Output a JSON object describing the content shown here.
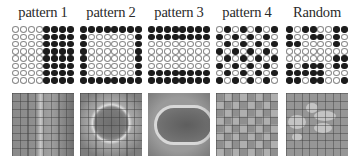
{
  "figure": {
    "columns": [
      {
        "title": "pattern 1",
        "grid": [
          [
            0,
            0,
            0,
            0,
            1,
            1,
            1,
            1
          ],
          [
            0,
            0,
            0,
            0,
            1,
            1,
            1,
            1
          ],
          [
            0,
            0,
            0,
            0,
            1,
            1,
            1,
            1
          ],
          [
            0,
            0,
            0,
            0,
            1,
            1,
            1,
            1
          ],
          [
            0,
            0,
            0,
            0,
            1,
            1,
            1,
            1
          ],
          [
            0,
            0,
            0,
            0,
            1,
            1,
            1,
            1
          ],
          [
            0,
            0,
            0,
            0,
            1,
            1,
            1,
            1
          ],
          [
            0,
            0,
            0,
            0,
            1,
            1,
            1,
            1
          ]
        ],
        "map_description": "vertical bright band with arc on right"
      },
      {
        "title": "pattern 2",
        "grid": [
          [
            1,
            1,
            1,
            1,
            1,
            1,
            1,
            1
          ],
          [
            1,
            0,
            0,
            0,
            0,
            0,
            0,
            1
          ],
          [
            1,
            0,
            0,
            0,
            0,
            0,
            0,
            1
          ],
          [
            1,
            0,
            0,
            0,
            0,
            0,
            0,
            1
          ],
          [
            1,
            0,
            0,
            0,
            0,
            0,
            0,
            1
          ],
          [
            1,
            0,
            0,
            0,
            0,
            0,
            0,
            1
          ],
          [
            1,
            0,
            0,
            0,
            0,
            0,
            0,
            1
          ],
          [
            1,
            1,
            1,
            1,
            1,
            1,
            1,
            1
          ]
        ],
        "map_description": "bright ring around dark center"
      },
      {
        "title": "pattern 3",
        "grid": [
          [
            1,
            1,
            1,
            1,
            1,
            1,
            1,
            1
          ],
          [
            1,
            1,
            1,
            1,
            1,
            1,
            1,
            1
          ],
          [
            0,
            0,
            0,
            0,
            0,
            0,
            0,
            0
          ],
          [
            0,
            0,
            0,
            0,
            0,
            0,
            0,
            0
          ],
          [
            0,
            0,
            0,
            0,
            0,
            0,
            0,
            0
          ],
          [
            0,
            0,
            0,
            0,
            0,
            0,
            0,
            0
          ],
          [
            1,
            1,
            1,
            1,
            1,
            1,
            1,
            1
          ],
          [
            1,
            1,
            1,
            1,
            1,
            1,
            1,
            1
          ]
        ],
        "map_description": "bright rounded-rectangle outline around dark center"
      },
      {
        "title": "pattern 4",
        "grid": [
          [
            0,
            1,
            0,
            1,
            0,
            1,
            0,
            1
          ],
          [
            1,
            0,
            1,
            0,
            1,
            0,
            1,
            0
          ],
          [
            0,
            1,
            0,
            1,
            0,
            1,
            0,
            1
          ],
          [
            1,
            0,
            1,
            0,
            1,
            0,
            1,
            0
          ],
          [
            0,
            1,
            0,
            1,
            0,
            1,
            0,
            1
          ],
          [
            1,
            0,
            1,
            0,
            1,
            0,
            1,
            0
          ],
          [
            0,
            1,
            0,
            1,
            0,
            1,
            0,
            1
          ],
          [
            1,
            0,
            1,
            0,
            1,
            0,
            1,
            0
          ]
        ],
        "map_description": "checkerboard of light squares"
      },
      {
        "title": "Random",
        "grid": [
          [
            1,
            0,
            1,
            1,
            0,
            0,
            1,
            1
          ],
          [
            1,
            0,
            0,
            1,
            1,
            0,
            1,
            0
          ],
          [
            1,
            1,
            0,
            0,
            0,
            0,
            1,
            0
          ],
          [
            0,
            0,
            0,
            0,
            0,
            0,
            0,
            0
          ],
          [
            0,
            0,
            0,
            0,
            0,
            0,
            1,
            1
          ],
          [
            1,
            0,
            1,
            1,
            1,
            0,
            1,
            1
          ],
          [
            1,
            1,
            1,
            1,
            1,
            0,
            0,
            0
          ],
          [
            1,
            1,
            0,
            1,
            1,
            0,
            0,
            1
          ]
        ],
        "map_description": "irregular bright blobs"
      }
    ],
    "colors": {
      "dot_on": "#1c1c1c",
      "dot_off_border": "#8a8a8a",
      "map_base": "#8d8d8d"
    }
  }
}
